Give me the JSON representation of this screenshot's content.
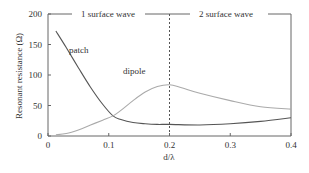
{
  "chart_data": {
    "type": "line",
    "title": "",
    "xlabel": "d/λ",
    "ylabel": "Resonant resistance (Ω)",
    "xlim": [
      0,
      0.4
    ],
    "ylim": [
      0,
      200
    ],
    "x_ticks": [
      "0",
      "0.1",
      "0.2",
      "0.3",
      "0.4"
    ],
    "y_ticks": [
      "0",
      "50",
      "100",
      "150",
      "200"
    ],
    "grid": false,
    "regions": [
      {
        "label": "1 surface wave",
        "x_range": [
          0,
          0.2
        ]
      },
      {
        "label": "2 surface wave",
        "x_range": [
          0.2,
          0.4
        ]
      }
    ],
    "annotations": [
      {
        "type": "vline",
        "x": 0.2,
        "style": "dashed"
      }
    ],
    "series": [
      {
        "name": "patch",
        "color": "#555555",
        "x": [
          0.013,
          0.03,
          0.05,
          0.07,
          0.09,
          0.107,
          0.12,
          0.14,
          0.16,
          0.18,
          0.2,
          0.25,
          0.3,
          0.35,
          0.4
        ],
        "y": [
          172,
          145,
          112,
          80,
          52,
          33,
          27,
          22,
          20,
          19,
          19,
          18,
          20,
          24,
          30
        ]
      },
      {
        "name": "dipole",
        "color": "#aaaaaa",
        "x": [
          0.013,
          0.03,
          0.05,
          0.07,
          0.09,
          0.107,
          0.12,
          0.14,
          0.16,
          0.18,
          0.2,
          0.22,
          0.25,
          0.3,
          0.35,
          0.4
        ],
        "y": [
          2,
          4,
          10,
          18,
          26,
          33,
          42,
          58,
          72,
          81,
          84,
          79,
          70,
          58,
          48,
          44
        ]
      }
    ]
  },
  "labels": {
    "patch": "patch",
    "dipole": "dipole",
    "region1": "1 surface wave",
    "region2": "2 surface wave",
    "xlabel": "d/λ",
    "ylabel": "Resonant resistance (Ω)"
  }
}
